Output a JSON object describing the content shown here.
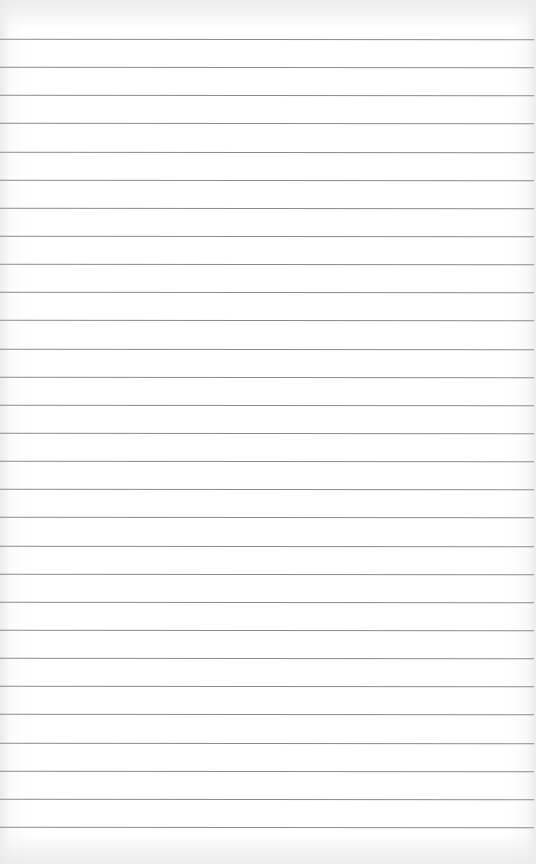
{
  "page": {
    "type": "blank-lined-paper",
    "line_color": "#8a8a8a",
    "background_color": "#ffffff",
    "lines": {
      "count": 29,
      "first_y": 39,
      "spacing": 28.14
    }
  }
}
